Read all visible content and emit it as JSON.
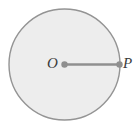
{
  "figure": {
    "type": "geometry-diagram",
    "background_color": "#ffffff",
    "circle": {
      "name": "circle",
      "center_x": 64.5,
      "center_y": 64.5,
      "radius": 55.5,
      "fill_color": "#ededed",
      "stroke_color": "#949494",
      "stroke_width": 1.4
    },
    "radius_segment": {
      "name": "radius-segment",
      "x1": 64.5,
      "y1": 64.5,
      "x2": 119.5,
      "y2": 64.5,
      "stroke_color": "#8f8f8f",
      "stroke_width": 2.6
    },
    "points": [
      {
        "id": "center",
        "label": "O",
        "cx": 64.5,
        "cy": 64.5,
        "dot_radius": 3.2,
        "dot_color": "#8f8f8f",
        "label_x": 47,
        "label_y": 56
      },
      {
        "id": "perimeter",
        "label": "P",
        "cx": 119.5,
        "cy": 64.5,
        "dot_radius": 3.2,
        "dot_color": "#8f8f8f",
        "label_x": 123,
        "label_y": 56
      }
    ]
  }
}
